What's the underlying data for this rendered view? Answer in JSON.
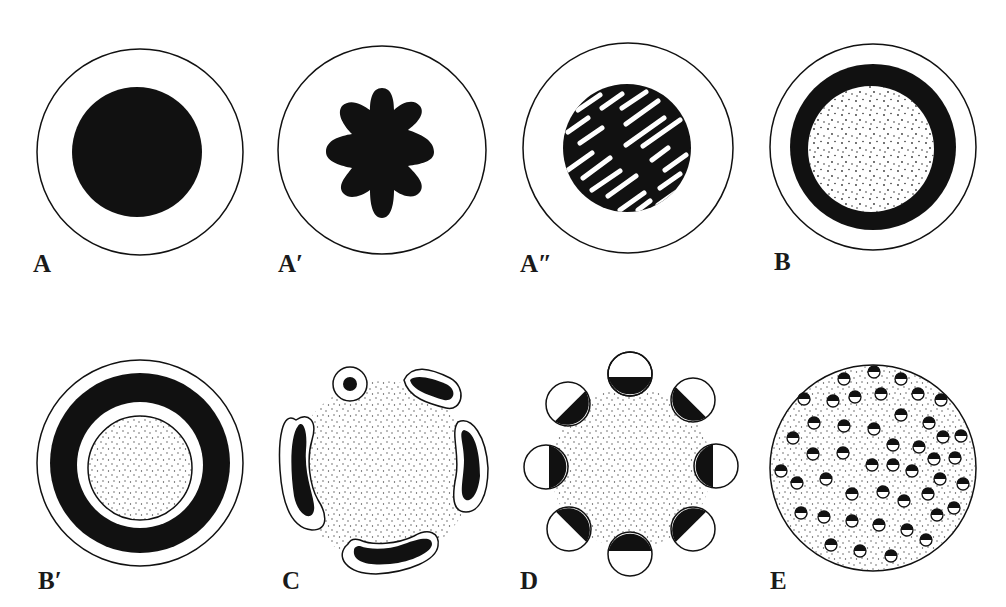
{
  "figure": {
    "background": "#ffffff",
    "ink": "#111111",
    "panels": [
      {
        "id": "A",
        "label": "A",
        "x": 33,
        "y": 251,
        "description": "solid dark core within outer circle"
      },
      {
        "id": "A1",
        "label": "A′",
        "x": 278,
        "y": 251,
        "description": "dark eight-lobed star within outer circle"
      },
      {
        "id": "A2",
        "label": "A″",
        "x": 520,
        "y": 251,
        "description": "dark disk with white diagonal streaks within outer circle"
      },
      {
        "id": "B",
        "label": "B",
        "x": 774,
        "y": 249,
        "description": "dark ring surrounding stippled core"
      },
      {
        "id": "B1",
        "label": "B′",
        "x": 38,
        "y": 568,
        "description": "dark ring, white gap, outlined stippled core"
      },
      {
        "id": "C",
        "label": "C",
        "x": 282,
        "y": 568,
        "description": "five separate outlined dark segments around stippled center"
      },
      {
        "id": "D",
        "label": "D",
        "x": 520,
        "y": 568,
        "description": "eight half-dark circles arranged around stippled center"
      },
      {
        "id": "E",
        "label": "E",
        "x": 770,
        "y": 568,
        "description": "stippled disk with many small half-dark granules"
      }
    ]
  }
}
